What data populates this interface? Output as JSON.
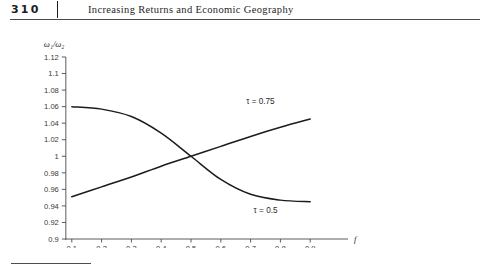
{
  "header": {
    "folio": "310",
    "running_title": "Increasing Returns and Economic Geography"
  },
  "chart_data": {
    "type": "line",
    "title": "",
    "xlabel": "f",
    "ylabel": "ω₁/ω₂",
    "xlim": [
      0.0,
      1.0
    ],
    "ylim": [
      0.9,
      1.12
    ],
    "grid": false,
    "legend_position": "inline-annotation",
    "x_ticks": [
      "0.1",
      "0.2",
      "0.3",
      "0.4",
      "0.5",
      "0.6",
      "0.7",
      "0.8",
      "0.9"
    ],
    "x_tick_values": [
      0.1,
      0.2,
      0.3,
      0.4,
      0.5,
      0.6,
      0.7,
      0.8,
      0.9
    ],
    "y_ticks": [
      "1.12",
      "1.1",
      "1.08",
      "1.06",
      "1.04",
      "1.02",
      "1",
      "0.98",
      "0.96",
      "0.94",
      "0.92",
      "0.9"
    ],
    "y_tick_values": [
      1.12,
      1.1,
      1.08,
      1.06,
      1.04,
      1.02,
      1.0,
      0.98,
      0.96,
      0.94,
      0.92,
      0.9
    ],
    "x": [
      0.1,
      0.2,
      0.3,
      0.4,
      0.5,
      0.6,
      0.7,
      0.8,
      0.9
    ],
    "series": [
      {
        "name": "τ = 0.5",
        "label": "τ = 0.5",
        "values": [
          1.06,
          1.057,
          1.048,
          1.028,
          1.0,
          0.972,
          0.954,
          0.947,
          0.945
        ],
        "annotation_x": 0.71,
        "annotation_y": 0.932
      },
      {
        "name": "τ = 0.75",
        "label": "τ = 0.75",
        "values": [
          0.951,
          0.963,
          0.975,
          0.988,
          1.0,
          1.012,
          1.024,
          1.035,
          1.045
        ],
        "annotation_x": 0.685,
        "annotation_y": 1.063
      }
    ],
    "crossing_point": {
      "x": 0.5,
      "y": 1.0
    }
  }
}
